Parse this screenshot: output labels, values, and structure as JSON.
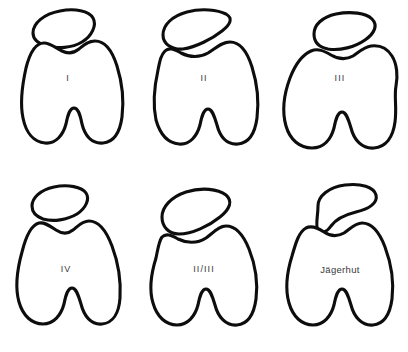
{
  "figure": {
    "background_color": "#ffffff",
    "stroke_color": "#0d0d0d",
    "label_color": "#3a3a3a",
    "rows": 2,
    "columns": 3
  },
  "panels": [
    {
      "id": "panel-type-1",
      "label": "I",
      "label_x": 68,
      "label_y": 79,
      "row": 1,
      "column": 1,
      "patella_name": "patella-outline-type-1",
      "femur_name": "femoral-condyle-outline-type-1",
      "patella_path": "M 33 33 C 33 23, 44 14, 60 11 C 75 8, 89 11, 93 18 C 97 25, 92 36, 82 42 C 72 48, 57 49, 46 46 C 37 43, 33 39, 33 33 Z",
      "femur_path": "M 26 68 C 22 86, 20 104, 23 118 C 26 133, 34 142, 45 143 C 56 144, 63 135, 66 124 C 68 114, 70 108, 74 108 C 78 108, 80 114, 82 124 C 85 136, 92 144, 103 143 C 114 142, 120 132, 122 117 C 124 101, 122 82, 117 66 C 112 50, 104 41, 95 41 C 88 41, 84 45, 79 49 C 74 53, 68 54, 62 51 C 56 48, 50 43, 44 43 C 36 43, 30 52, 26 68 Z"
    },
    {
      "id": "panel-type-2",
      "label": "II",
      "label_x": 68,
      "label_y": 79,
      "row": 1,
      "column": 2,
      "patella_name": "patella-outline-type-2",
      "femur_name": "femoral-condyle-outline-type-2",
      "patella_path": "M 27 35 C 27 25, 36 16, 51 12 C 66 8, 82 10, 90 14 C 97 18, 95 24, 86 31 C 76 39, 60 47, 47 49 C 36 50, 27 44, 27 35 Z",
      "femur_path": "M 22 70 C 18 88, 17 106, 20 120 C 24 134, 32 143, 43 144 C 54 145, 61 136, 64 125 C 66 115, 68 109, 72 109 C 76 109, 78 115, 81 125 C 84 137, 91 145, 102 144 C 113 143, 119 133, 121 118 C 123 102, 121 83, 116 67 C 111 51, 103 42, 94 42 C 86 42, 80 48, 72 53 C 63 58, 53 57, 45 53 C 38 49, 33 47, 29 51 C 25 55, 24 60, 22 70 Z"
    },
    {
      "id": "panel-type-3",
      "label": "III",
      "label_x": 68,
      "label_y": 79,
      "row": 1,
      "column": 3,
      "patella_name": "patella-outline-type-3",
      "femur_name": "femoral-condyle-outline-type-3",
      "patella_path": "M 42 34 C 42 25, 50 17, 64 14 C 79 11, 94 13, 100 19 C 106 25, 103 33, 93 40 C 83 47, 68 51, 56 49 C 46 47, 42 41, 42 34 Z",
      "femur_path": "M 18 78 C 12 94, 10 112, 14 126 C 18 140, 28 148, 40 148 C 52 148, 59 139, 62 128 C 64 118, 66 112, 70 112 C 74 112, 76 118, 79 128 C 82 140, 90 149, 102 148 C 114 147, 121 137, 123 122 C 125 107, 122 96, 124 86 C 126 76, 125 64, 120 56 C 115 48, 107 45, 99 46 C 92 47, 87 52, 81 56 C 74 60, 66 59, 59 55 C 52 51, 46 48, 39 51 C 30 55, 23 65, 18 78 Z"
    },
    {
      "id": "panel-type-4",
      "label": "IV",
      "label_x": 66,
      "label_y": 94,
      "row": 2,
      "column": 1,
      "patella_name": "patella-outline-type-4",
      "femur_name": "femoral-condyle-outline-type-4",
      "patella_path": "M 32 30 C 32 22, 40 14, 54 11 C 68 8, 82 11, 86 17 C 90 23, 86 32, 77 38 C 67 44, 53 46, 43 43 C 35 40, 32 36, 32 30 Z",
      "femur_path": "M 22 76 C 17 94, 15 112, 19 126 C 23 140, 32 148, 43 148 C 54 148, 61 139, 64 128 C 66 118, 68 112, 72 112 C 76 112, 78 118, 81 128 C 84 140, 91 149, 102 148 C 113 147, 119 137, 120 122 C 121 106, 118 86, 112 70 C 106 54, 98 45, 89 45 C 82 45, 78 50, 73 54 C 68 58, 62 58, 56 54 C 50 50, 45 46, 39 47 C 31 49, 26 60, 22 76 Z"
    },
    {
      "id": "panel-type-2-3",
      "label": "II/III",
      "label_x": 68,
      "label_y": 94,
      "row": 2,
      "column": 2,
      "patella_name": "patella-outline-type-2-3",
      "femur_name": "femoral-condyle-outline-type-2-3",
      "patella_path": "M 26 41 C 26 31, 35 21, 50 16 C 66 11, 82 13, 90 19 C 97 25, 94 33, 84 41 C 73 50, 56 58, 43 58 C 32 58, 26 50, 26 41 Z",
      "femur_path": "M 20 82 C 15 98, 13 114, 17 127 C 21 141, 30 149, 41 149 C 52 149, 59 140, 62 129 C 64 119, 66 113, 70 113 C 74 113, 76 119, 79 129 C 82 141, 90 150, 101 149 C 112 148, 118 138, 120 123 C 122 107, 119 88, 113 73 C 107 58, 99 50, 90 50 C 83 50, 78 56, 70 62 C 61 68, 50 67, 42 63 C 35 59, 30 57, 26 61 C 23 65, 22 72, 20 82 Z"
    },
    {
      "id": "panel-jaegerhut",
      "label": "Jägerhut",
      "label_x": 68,
      "label_y": 94,
      "row": 2,
      "column": 3,
      "patella_name": "patella-outline-jaegerhut",
      "femur_name": "femoral-condyle-outline-jaegerhut",
      "patella_path": "M 46 30 C 46 20, 57 11, 73 9 C 89 7, 102 11, 104 19 C 106 27, 97 33, 84 36 C 72 39, 64 43, 59 50 C 55 56, 50 58, 46 54 C 43 50, 46 40, 46 30 Z",
      "femur_path": "M 20 80 C 15 96, 13 113, 17 127 C 21 141, 30 149, 41 149 C 52 149, 59 140, 62 129 C 64 119, 66 113, 70 113 C 74 113, 76 119, 79 129 C 82 141, 90 150, 101 149 C 112 148, 118 138, 120 123 C 122 107, 119 87, 113 71 C 107 55, 99 47, 90 47 C 83 47, 78 53, 72 57 C 65 61, 58 60, 52 56 C 46 52, 40 49, 34 52 C 27 56, 24 66, 20 80 Z"
    }
  ]
}
